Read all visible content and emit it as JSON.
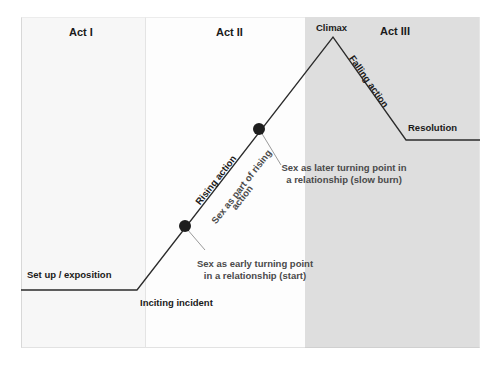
{
  "diagram": {
    "type": "plot-structure-arc",
    "acts": [
      {
        "id": "act1",
        "label": "Act I"
      },
      {
        "id": "act2",
        "label": "Act II"
      },
      {
        "id": "act3",
        "label": "Act III"
      }
    ],
    "stages": {
      "setup": "Set up / exposition",
      "inciting": "Inciting incident",
      "rising": "Rising action",
      "climax": "Climax",
      "falling": "Falling action",
      "resolution": "Resolution"
    },
    "annotations": {
      "sex_rising": {
        "line1": "Sex as part of rising",
        "line2": "action"
      },
      "sex_early": {
        "line1": "Sex as early turning point",
        "line2": "in a relationship (start)"
      },
      "sex_late": {
        "line1": "Sex as later turning point in",
        "line2": "a relationship (slow burn)"
      }
    },
    "arc_points": [
      [
        21,
        290
      ],
      [
        137,
        290
      ],
      [
        333,
        37
      ],
      [
        406,
        140
      ],
      [
        480,
        140
      ]
    ],
    "markers": [
      {
        "name": "early-turning-point",
        "x": 185,
        "y": 226
      },
      {
        "name": "later-turning-point",
        "x": 259,
        "y": 129
      }
    ],
    "colors": {
      "act1_bg": "#f7f7f7",
      "act2_bg": "#fdfdfd",
      "act3_bg": "#dedede",
      "line": "#2b2b2b",
      "marker": "#1e1e1e",
      "leader": "#9a9a9a",
      "label_text": "#1a1a1a",
      "note_text": "#4a4a4a"
    }
  }
}
